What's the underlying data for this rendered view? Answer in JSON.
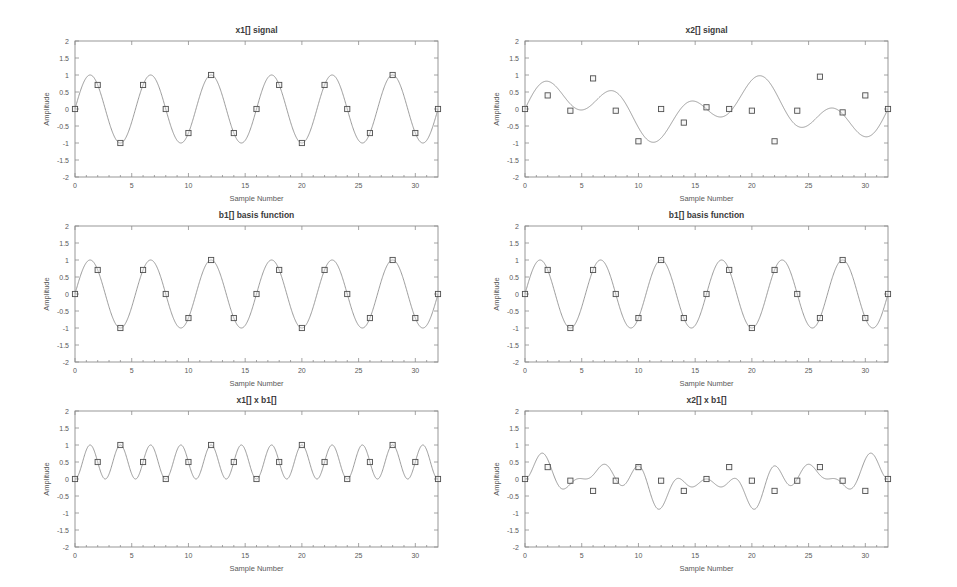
{
  "figure": {
    "background_color": "#ffffff",
    "width": 957,
    "height": 587,
    "line_color": "#8a8a8a",
    "marker_edge_color": "#4f4f4f",
    "axis_color": "#8d8d8d"
  },
  "common": {
    "xlabel": "Sample Number",
    "ylabel": "Amplitude",
    "xlim": [
      0,
      32
    ],
    "ylim": [
      -2,
      2
    ],
    "xticks": [
      0,
      5,
      10,
      15,
      20,
      25,
      30
    ],
    "xticklabels": [
      "0",
      "5",
      "10",
      "15",
      "20",
      "25",
      "30"
    ],
    "yticks": [
      -2,
      -1.5,
      -1,
      -0.5,
      0,
      0.5,
      1,
      1.5,
      2
    ],
    "yticklabels": [
      "-2",
      "-1.5",
      "-1",
      "-0.5",
      "0",
      "0.5",
      "1",
      "1.5",
      "2"
    ],
    "grid": false,
    "marker": "square",
    "sample_step": 2
  },
  "chart_data": [
    {
      "id": "x1-signal",
      "type": "line",
      "title": "x1[] signal",
      "xlabel": "Sample Number",
      "ylabel": "Amplitude",
      "xlim": [
        0,
        32
      ],
      "ylim": [
        -2,
        2
      ],
      "grid": false,
      "position": "top-left",
      "description": "sine with period 5.333 samples (6 cycles over 32 samples)",
      "formula": "sin(2*pi*6*n/32)",
      "x": [
        0,
        2,
        4,
        6,
        8,
        10,
        12,
        14,
        16,
        18,
        20,
        22,
        24,
        26,
        28,
        30,
        32
      ],
      "values": [
        0,
        0.707,
        -1,
        0.707,
        0,
        -0.707,
        1,
        -0.707,
        0,
        0.707,
        -1,
        0.707,
        0,
        -0.707,
        1,
        -0.707,
        0
      ]
    },
    {
      "id": "x2-signal",
      "type": "line",
      "title": "x2[] signal",
      "xlabel": "Sample Number",
      "ylabel": "Amplitude",
      "xlim": [
        0,
        32
      ],
      "ylim": [
        -2,
        2
      ],
      "grid": false,
      "position": "top-right",
      "description": "sum of two sinusoids, period 16 samples",
      "formula": "0.5*sin(2*pi*2*n/32) + 0.5*sin(2*pi*5*n/32)",
      "x": [
        0,
        2,
        4,
        6,
        8,
        10,
        12,
        14,
        16,
        18,
        20,
        22,
        24,
        26,
        28,
        30,
        32
      ],
      "values": [
        0,
        0.4,
        -0.05,
        0.9,
        -0.05,
        -0.95,
        0.0,
        -0.4,
        0.05,
        0.0,
        -0.05,
        -0.95,
        -0.05,
        0.95,
        -0.1,
        0.4,
        0.0
      ]
    },
    {
      "id": "b1-basis-left",
      "type": "line",
      "title": "b1[] basis function",
      "xlabel": "Sample Number",
      "ylabel": "Amplitude",
      "xlim": [
        0,
        32
      ],
      "ylim": [
        -2,
        2
      ],
      "grid": false,
      "position": "middle-left",
      "description": "sine basis function, 6 cycles over 32 samples",
      "formula": "sin(2*pi*6*n/32)",
      "x": [
        0,
        2,
        4,
        6,
        8,
        10,
        12,
        14,
        16,
        18,
        20,
        22,
        24,
        26,
        28,
        30,
        32
      ],
      "values": [
        0,
        0.707,
        -1,
        0.707,
        0,
        -0.707,
        1,
        -0.707,
        0,
        0.707,
        -1,
        0.707,
        0,
        -0.707,
        1,
        -0.707,
        0
      ]
    },
    {
      "id": "b1-basis-right",
      "type": "line",
      "title": "b1[] basis function",
      "xlabel": "Sample Number",
      "ylabel": "Amplitude",
      "xlim": [
        0,
        32
      ],
      "ylim": [
        -2,
        2
      ],
      "grid": false,
      "position": "middle-right",
      "description": "sine basis function, 6 cycles over 32 samples",
      "formula": "sin(2*pi*6*n/32)",
      "x": [
        0,
        2,
        4,
        6,
        8,
        10,
        12,
        14,
        16,
        18,
        20,
        22,
        24,
        26,
        28,
        30,
        32
      ],
      "values": [
        0,
        0.707,
        -1,
        0.707,
        0,
        -0.707,
        1,
        -0.707,
        0,
        0.707,
        -1,
        0.707,
        0,
        -0.707,
        1,
        -0.707,
        0
      ]
    },
    {
      "id": "x1-times-b1",
      "type": "line",
      "title": "x1[] x b1[]",
      "xlabel": "Sample Number",
      "ylabel": "Amplitude",
      "xlim": [
        0,
        32
      ],
      "ylim": [
        -2,
        2
      ],
      "grid": false,
      "position": "bottom-left",
      "description": "product of x1 and b1, equals sin squared, always non-negative, mean 0.5",
      "formula": "sin(2*pi*6*n/32)^2",
      "x": [
        0,
        2,
        4,
        6,
        8,
        10,
        12,
        14,
        16,
        18,
        20,
        22,
        24,
        26,
        28,
        30,
        32
      ],
      "values": [
        0,
        0.5,
        1,
        0.5,
        0,
        0.5,
        1,
        0.5,
        0,
        0.5,
        1,
        0.5,
        0,
        0.5,
        1,
        0.5,
        0
      ]
    },
    {
      "id": "x2-times-b1",
      "type": "line",
      "title": "x2[] x b1[]",
      "xlabel": "Sample Number",
      "ylabel": "Amplitude",
      "xlim": [
        0,
        32
      ],
      "ylim": [
        -2,
        2
      ],
      "grid": false,
      "position": "bottom-right",
      "description": "product of x2 and b1, oscillates about zero, mean approximately zero",
      "formula": "x2(n) * sin(2*pi*6*n/32)",
      "x": [
        0,
        2,
        4,
        6,
        8,
        10,
        12,
        14,
        16,
        18,
        20,
        22,
        24,
        26,
        28,
        30,
        32
      ],
      "values": [
        0,
        0.35,
        -0.05,
        -0.35,
        -0.05,
        0.35,
        -0.05,
        -0.35,
        0.0,
        0.35,
        -0.05,
        -0.35,
        -0.05,
        0.35,
        -0.05,
        -0.35,
        0.0
      ]
    }
  ]
}
